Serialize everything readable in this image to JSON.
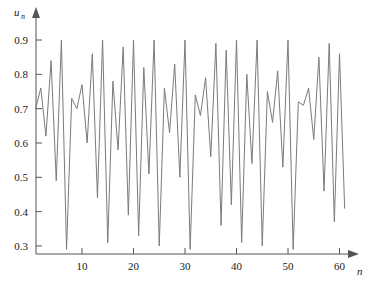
{
  "chart_data": {
    "type": "line",
    "title": "",
    "subtitle": "",
    "xlabel": "n",
    "ylabel": "u_n",
    "ylabel_base": "u",
    "ylabel_sub": "n",
    "grid": false,
    "legend": null,
    "legend_position": "none",
    "line_color": "#7a7a80",
    "axis_color": "#555555",
    "xlim": [
      0,
      62
    ],
    "ylim": [
      0.27,
      0.93
    ],
    "xticks": [
      10,
      20,
      30,
      40,
      50,
      60
    ],
    "xtick_labels": [
      "10",
      "20",
      "30",
      "40",
      "50",
      "60"
    ],
    "yticks": [
      0.3,
      0.4,
      0.5,
      0.6,
      0.7,
      0.8,
      0.9
    ],
    "ytick_labels": [
      "0.3",
      "0.4",
      "0.5",
      "0.6",
      "0.7",
      "0.8",
      "0.9"
    ],
    "x": [
      1,
      2,
      3,
      4,
      5,
      6,
      7,
      8,
      9,
      10,
      11,
      12,
      13,
      14,
      15,
      16,
      17,
      18,
      19,
      20,
      21,
      22,
      23,
      24,
      25,
      26,
      27,
      28,
      29,
      30,
      31,
      32,
      33,
      34,
      35,
      36,
      37,
      38,
      39,
      40,
      41,
      42,
      43,
      44,
      45,
      46,
      47,
      48,
      49,
      50,
      51,
      52,
      53,
      54,
      55,
      56,
      57,
      58,
      59,
      60,
      61
    ],
    "values": [
      0.7,
      0.76,
      0.62,
      0.84,
      0.49,
      0.9,
      0.29,
      0.73,
      0.7,
      0.77,
      0.6,
      0.86,
      0.44,
      0.9,
      0.31,
      0.78,
      0.58,
      0.88,
      0.39,
      0.9,
      0.33,
      0.82,
      0.51,
      0.9,
      0.3,
      0.76,
      0.63,
      0.83,
      0.5,
      0.9,
      0.29,
      0.74,
      0.68,
      0.79,
      0.56,
      0.89,
      0.36,
      0.87,
      0.42,
      0.9,
      0.31,
      0.8,
      0.54,
      0.9,
      0.3,
      0.75,
      0.66,
      0.81,
      0.53,
      0.9,
      0.29,
      0.72,
      0.71,
      0.76,
      0.61,
      0.85,
      0.46,
      0.89,
      0.37,
      0.86,
      0.41
    ],
    "series": [
      {
        "name": "u_n",
        "values": [
          0.7,
          0.76,
          0.62,
          0.84,
          0.49,
          0.9,
          0.29,
          0.73,
          0.7,
          0.77,
          0.6,
          0.86,
          0.44,
          0.9,
          0.31,
          0.78,
          0.58,
          0.88,
          0.39,
          0.9,
          0.33,
          0.82,
          0.51,
          0.9,
          0.3,
          0.76,
          0.63,
          0.83,
          0.5,
          0.9,
          0.29,
          0.74,
          0.68,
          0.79,
          0.56,
          0.89,
          0.36,
          0.87,
          0.42,
          0.9,
          0.31,
          0.8,
          0.54,
          0.9,
          0.3,
          0.75,
          0.66,
          0.81,
          0.53,
          0.9,
          0.29,
          0.72,
          0.71,
          0.76,
          0.61,
          0.85,
          0.46,
          0.89,
          0.37,
          0.86,
          0.41
        ]
      }
    ]
  }
}
